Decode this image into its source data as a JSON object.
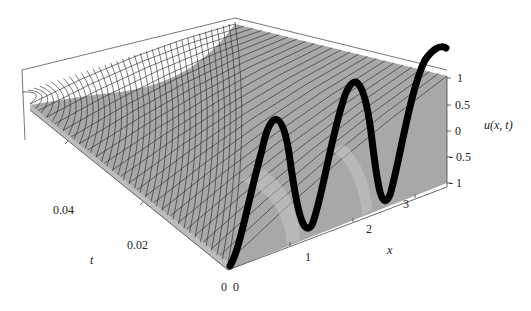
{
  "chart_data": {
    "type": "surface3d",
    "title": "",
    "xlabel": "x",
    "ylabel": "t",
    "zlabel": "u(x, t)",
    "x_ticks": [
      "0",
      "1",
      "2",
      "3"
    ],
    "t_ticks": [
      "0",
      "0.02",
      "0.04"
    ],
    "z_ticks": [
      "1",
      "0.5",
      "0",
      "- 0.5",
      "- 1"
    ],
    "xlim": [
      0,
      3.14
    ],
    "tlim": [
      0,
      0.05
    ],
    "zlim": [
      -1,
      1
    ],
    "initial_curve": {
      "t": 0,
      "x": [
        0,
        0.45,
        0.9,
        1.35,
        1.8,
        2.25,
        2.7,
        3.14
      ],
      "u": [
        -1,
        1,
        -1,
        1,
        -1,
        1,
        -1,
        1
      ]
    },
    "surface_color": "#a8a8a8",
    "mesh_color": "#222222",
    "curve_color": "#000000"
  }
}
